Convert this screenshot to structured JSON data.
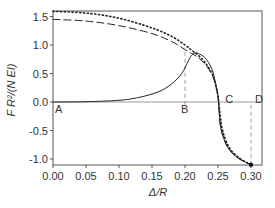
{
  "chart_data": {
    "type": "line",
    "title": "",
    "xlabel": "Δ/R",
    "ylabel": "F R²/(N EI)",
    "xlim": [
      0.0,
      0.31
    ],
    "ylim": [
      -1.12,
      1.62
    ],
    "grid": false,
    "legend": null,
    "x_ticks": [
      "0.00",
      "0.05",
      "0.10",
      "0.15",
      "0.20",
      "0.25",
      "0.30"
    ],
    "y_ticks": [
      "-1.0",
      "-0.5",
      "0.0",
      "0.5",
      "1.0",
      "1.5"
    ],
    "series": [
      {
        "name": "solid",
        "style": "solid",
        "points": [
          [
            0.0,
            0.0
          ],
          [
            0.05,
            0.005
          ],
          [
            0.1,
            0.03
          ],
          [
            0.13,
            0.08
          ],
          [
            0.16,
            0.18
          ],
          [
            0.18,
            0.32
          ],
          [
            0.195,
            0.5
          ],
          [
            0.205,
            0.72
          ],
          [
            0.21,
            0.82
          ],
          [
            0.215,
            0.86
          ],
          [
            0.22,
            0.85
          ],
          [
            0.23,
            0.78
          ],
          [
            0.24,
            0.6
          ],
          [
            0.245,
            0.4
          ],
          [
            0.25,
            0.1
          ],
          [
            0.252,
            -0.2
          ],
          [
            0.255,
            -0.5
          ],
          [
            0.265,
            -0.8
          ],
          [
            0.28,
            -0.98
          ],
          [
            0.3,
            -1.1
          ]
        ]
      },
      {
        "name": "dashed",
        "style": "dashed",
        "points": [
          [
            0.0,
            1.45
          ],
          [
            0.05,
            1.42
          ],
          [
            0.1,
            1.34
          ],
          [
            0.15,
            1.2
          ],
          [
            0.18,
            1.06
          ],
          [
            0.2,
            0.92
          ],
          [
            0.21,
            0.85
          ],
          [
            0.22,
            0.78
          ],
          [
            0.23,
            0.67
          ],
          [
            0.24,
            0.5
          ],
          [
            0.245,
            0.35
          ],
          [
            0.25,
            0.1
          ],
          [
            0.252,
            -0.2
          ],
          [
            0.255,
            -0.5
          ],
          [
            0.265,
            -0.8
          ],
          [
            0.28,
            -0.98
          ],
          [
            0.3,
            -1.1
          ]
        ]
      },
      {
        "name": "dotted",
        "style": "dotted",
        "points": [
          [
            0.0,
            1.59
          ],
          [
            0.05,
            1.56
          ],
          [
            0.1,
            1.47
          ],
          [
            0.15,
            1.3
          ],
          [
            0.18,
            1.15
          ],
          [
            0.2,
            1.0
          ],
          [
            0.21,
            0.91
          ],
          [
            0.22,
            0.82
          ],
          [
            0.23,
            0.7
          ],
          [
            0.24,
            0.52
          ],
          [
            0.245,
            0.36
          ],
          [
            0.25,
            0.1
          ],
          [
            0.253,
            -0.2
          ],
          [
            0.257,
            -0.5
          ],
          [
            0.267,
            -0.8
          ],
          [
            0.282,
            -0.98
          ],
          [
            0.3,
            -1.1
          ]
        ]
      }
    ],
    "reference_lines": [
      {
        "type": "horizontal",
        "y": 0.0,
        "style": "solid-thin"
      },
      {
        "type": "vertical",
        "x": 0.2,
        "y_from": -0.05,
        "y_to": 0.92,
        "style": "dashed"
      },
      {
        "type": "vertical",
        "x": 0.3,
        "y_from": -1.1,
        "y_to": 0.0,
        "style": "dashed"
      }
    ],
    "annotations": [
      {
        "text": "A",
        "x": 0.0,
        "y": -0.12
      },
      {
        "text": "B",
        "x": 0.2,
        "y": -0.12
      },
      {
        "text": "C",
        "x": 0.255,
        "y": 0.05
      },
      {
        "text": "D",
        "x": 0.3,
        "y": 0.05
      }
    ],
    "markers": [
      {
        "x": 0.3,
        "y": -1.1,
        "shape": "dot"
      }
    ]
  }
}
